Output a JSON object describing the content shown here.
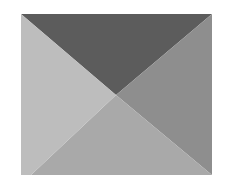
{
  "figure": {
    "shape": "rectangle divided into four triangles by its diagonals",
    "bounds": {
      "x": 21,
      "y": 14,
      "width": 191,
      "height": 161
    },
    "center": {
      "x": 116,
      "y": 95
    },
    "regions": [
      {
        "name": "top-triangle",
        "color": "#5c5c5c",
        "points": "21,14 212,14 116,95"
      },
      {
        "name": "right-triangle",
        "color": "#8e8e8e",
        "points": "212,14 212,175 116,95"
      },
      {
        "name": "bottom-triangle",
        "color": "#a9a9a9",
        "points": "31,175 212,175 116,95"
      },
      {
        "name": "left-triangle",
        "color": "#bdbdbd",
        "points": "21,14 116,95 31,175 21,175"
      }
    ]
  }
}
